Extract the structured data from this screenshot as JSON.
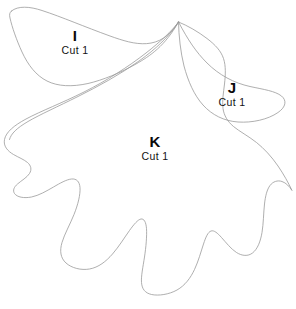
{
  "document": {
    "kind": "sewing-pattern-template",
    "background_color": "#ffffff",
    "outline_color": "#9a9a9a",
    "text_color": "#000000",
    "width": 296,
    "height": 309
  },
  "pieces": [
    {
      "id": "i",
      "letter": "I",
      "cut_instruction": "Cut 1",
      "description": "upper-left crescent wing lobe"
    },
    {
      "id": "j",
      "letter": "J",
      "cut_instruction": "Cut 1",
      "description": "right pointed side lobe"
    },
    {
      "id": "k",
      "letter": "K",
      "cut_instruction": "Cut 1",
      "description": "large lobed oak-leaf body"
    }
  ],
  "shapes": {
    "piece_i_path": "M 11.5 11.0 C 18.0 5.5 30.0 6.5 42.0 10.5 C 62.0 17.0 85.0 27.0 110.0 36.0 C 135.0 45.0 160.0 52.0 178.5 22.0 C 165.0 46.0 150.0 56.0 136.0 64.0 C 120.0 73.0 103.0 80.0 88.0 83.5 C 72.0 87.0 58.0 86.5 47.0 81.0 C 36.0 75.5 28.0 65.0 22.0 52.0 C 16.5 40.0 12.0 27.0 10.0 18.0 C 9.2 14.5 9.5 12.6 11.5 11.0 Z",
    "piece_j_path": "M 178.5 22.0 C 188.0 40.0 196.0 52.0 207.0 63.0 C 219.0 75.0 234.0 83.0 250.0 86.5 C 264.0 89.5 275.0 91.0 281.5 96.0 C 287.0 100.5 286.0 107.0 278.0 112.5 C 268.0 119.5 252.0 123.0 238.0 122.0 C 224.0 121.0 212.0 115.0 203.0 105.0 C 194.0 95.0 188.0 81.0 184.0 66.0 C 180.5 52.0 178.8 36.0 178.5 22.0 Z",
    "piece_k_path": "M 178.5 22.0 C 172.0 31.0 160.0 42.0 146.0 53.0 C 128.0 67.0 106.0 81.0 84.0 92.0 C 62.0 103.0 41.0 111.0 26.0 119.0 C 14.0 125.5 6.0 132.0 4.5 139.5 C 3.2 146.0 7.5 151.0 13.5 154.5 C 18.5 157.4 24.0 159.5 27.5 162.5 C 31.0 165.5 32.0 169.5 29.5 173.5 C 27.0 177.5 21.5 180.5 17.5 184.0 C 14.0 187.0 12.5 190.5 14.5 193.5 C 17.0 197.2 24.0 198.5 31.5 197.0 C 39.0 195.5 46.5 191.0 53.5 187.0 C 60.0 183.2 66.5 179.5 71.5 179.0 C 76.5 178.5 79.5 181.5 80.0 187.5 C 80.5 194.5 78.0 204.5 74.0 214.5 C 70.0 224.5 64.5 234.0 62.0 242.5 C 59.5 251.0 60.5 258.0 66.0 263.0 C 71.5 268.0 81.0 270.5 89.5 269.0 C 98.5 267.4 106.0 261.5 112.5 254.0 C 119.0 246.5 124.5 237.5 129.5 230.5 C 134.0 224.2 138.0 219.5 141.0 219.0 C 144.0 218.5 146.0 222.0 146.5 228.5 C 147.0 236.0 146.0 247.0 144.5 257.0 C 143.0 267.0 141.0 276.0 141.5 282.5 C 142.0 289.0 145.0 293.0 151.5 294.5 C 158.5 296.0 169.0 294.5 177.0 290.0 C 185.0 285.5 190.5 278.0 194.5 269.5 C 198.5 261.0 201.0 251.5 203.5 244.0 C 205.8 237.0 208.0 232.0 211.0 231.0 C 214.0 230.0 217.5 233.0 221.5 237.5 C 226.0 242.5 231.0 249.0 236.5 252.5 C 242.0 256.0 248.0 256.5 252.5 253.0 C 257.5 249.2 260.5 241.5 262.0 232.5 C 263.5 223.5 263.5 213.0 264.5 204.0 C 265.4 196.0 267.0 189.5 270.0 185.5 C 273.0 181.5 277.5 180.0 282.0 181.5 C 286.0 182.8 289.5 186.5 292.0 190.5 C 288.5 183.0 283.5 174.0 278.0 166.0 C 271.5 156.5 264.0 148.5 256.5 142.5 C 248.0 135.8 239.5 131.5 233.5 126.5 C 227.5 121.5 224.0 115.5 223.0 108.5 C 222.0 101.0 223.5 92.5 224.5 84.0 C 225.5 75.0 226.0 66.0 223.5 58.5 C 221.0 51.0 215.5 45.0 207.0 38.5 C 198.5 32.0 187.5 25.5 178.5 22.0 Z",
    "piece_k_inner_left_path": "M 178.5 22.0 C 170.0 35.5 156.0 49.0 139.0 61.0 C 120.0 74.5 98.0 86.5 78.0 96.5 C 58.0 106.5 40.0 114.5 28.0 121.5 C 17.0 128.0 11.0 133.5 9.5 139.5"
  },
  "labels": {
    "i": {
      "letter": "I",
      "cut": "Cut 1"
    },
    "j": {
      "letter": "J",
      "cut": "Cut 1"
    },
    "k": {
      "letter": "K",
      "cut": "Cut 1"
    }
  }
}
